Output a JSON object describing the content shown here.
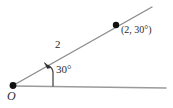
{
  "figure": {
    "background_color": "#ffffff",
    "width": 173,
    "height": 108,
    "labels": {
      "origin": "O",
      "radius": "2",
      "angle": "30°",
      "point": "(2, 30°)"
    },
    "colors": {
      "polar_axis": "#9a9a9a",
      "terminal_ray": "#8c8c8c",
      "angle_arrow": "#3a3a3a",
      "point_marker": "#111111",
      "text": "#2b2b2b"
    },
    "geometry": {
      "origin_point": {
        "x": 13,
        "y": 85
      },
      "polar_axis": {
        "x1": 13,
        "y1": 86,
        "x2": 166,
        "y2": 88
      },
      "terminal_ray": {
        "x1": 13,
        "y1": 85,
        "x2": 152,
        "y2": 7
      },
      "plotted_point": {
        "x": 116,
        "y": 25
      },
      "angle_arrow_stem": {
        "x": 53,
        "y_bottom": 86,
        "y_top": 72
      },
      "angle_arrow_head": {
        "x": 45,
        "y": 63
      }
    },
    "values": {
      "r": 2,
      "theta_degrees": 30
    }
  }
}
